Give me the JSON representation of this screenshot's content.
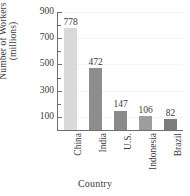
{
  "chart_data": {
    "type": "bar",
    "title": "",
    "xlabel": "Country",
    "ylabel_line1": "Number of Workers",
    "ylabel_line2": "(millions)",
    "categories": [
      "China",
      "India",
      "U.S.",
      "Indonesia",
      "Brazil"
    ],
    "values": [
      778,
      472,
      147,
      106,
      82
    ],
    "value_labels": [
      "778",
      "472",
      "147",
      "106",
      "82"
    ],
    "ylim": [
      0,
      900
    ],
    "yticks": [
      100,
      300,
      500,
      700,
      900
    ],
    "ytick_labels": [
      "100",
      "300",
      "500",
      "700",
      "900"
    ],
    "yminor_ticks": [
      200,
      400,
      600,
      800
    ],
    "grid": false,
    "legend": "none",
    "bar_colors": [
      "#d9d9d9",
      "#8d8d8d",
      "#8a8a8a",
      "#9d9d9d",
      "#7c7c7c"
    ],
    "axis_color": "#6e6e6e",
    "text_color": "#3b3b3b"
  },
  "axes": {
    "y_title_line1": "Number of Workers",
    "y_title_line2": "(millions)",
    "x_title": "Country"
  }
}
